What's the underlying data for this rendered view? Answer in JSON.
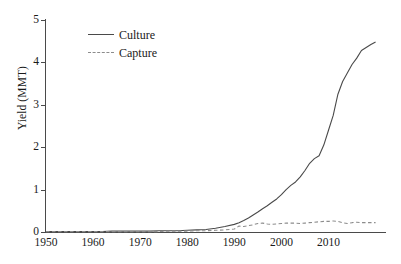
{
  "chart_data": {
    "type": "line",
    "title": "",
    "xlabel": "",
    "ylabel": "Yield (MMT)",
    "xlim": [
      1950,
      2022
    ],
    "ylim": [
      0,
      5
    ],
    "xticks": [
      1950,
      1960,
      1970,
      1980,
      1990,
      2000,
      2010
    ],
    "yticks": [
      0,
      1,
      2,
      3,
      4,
      5
    ],
    "grid": false,
    "legend_position": "top-left",
    "x": [
      1950,
      1952,
      1954,
      1956,
      1958,
      1960,
      1962,
      1964,
      1966,
      1968,
      1970,
      1972,
      1974,
      1976,
      1978,
      1980,
      1982,
      1984,
      1986,
      1988,
      1990,
      1991,
      1992,
      1993,
      1994,
      1995,
      1996,
      1997,
      1998,
      1999,
      2000,
      2001,
      2002,
      2003,
      2004,
      2005,
      2006,
      2007,
      2008,
      2009,
      2010,
      2011,
      2012,
      2013,
      2014,
      2015,
      2016,
      2017,
      2018,
      2019,
      2020
    ],
    "series": [
      {
        "name": "Culture",
        "style": "solid",
        "color": "#4a4a4a",
        "values": [
          0.01,
          0.01,
          0.01,
          0.01,
          0.01,
          0.01,
          0.01,
          0.02,
          0.02,
          0.02,
          0.02,
          0.02,
          0.03,
          0.03,
          0.03,
          0.04,
          0.05,
          0.06,
          0.09,
          0.13,
          0.18,
          0.22,
          0.27,
          0.33,
          0.4,
          0.47,
          0.55,
          0.62,
          0.7,
          0.78,
          0.88,
          1.0,
          1.1,
          1.18,
          1.3,
          1.45,
          1.62,
          1.73,
          1.8,
          2.05,
          2.4,
          2.75,
          3.25,
          3.55,
          3.75,
          3.95,
          4.1,
          4.28,
          4.35,
          4.42,
          4.48
        ]
      },
      {
        "name": "Capture",
        "style": "dashed",
        "color": "#8c8c8c",
        "values": [
          0.01,
          0.01,
          0.01,
          0.01,
          0.01,
          0.01,
          0.01,
          0.01,
          0.01,
          0.01,
          0.01,
          0.01,
          0.01,
          0.02,
          0.02,
          0.02,
          0.03,
          0.03,
          0.04,
          0.05,
          0.07,
          0.14,
          0.13,
          0.15,
          0.17,
          0.2,
          0.21,
          0.19,
          0.18,
          0.19,
          0.2,
          0.21,
          0.21,
          0.21,
          0.2,
          0.21,
          0.22,
          0.23,
          0.24,
          0.25,
          0.25,
          0.26,
          0.25,
          0.22,
          0.2,
          0.22,
          0.23,
          0.22,
          0.22,
          0.22,
          0.22
        ]
      }
    ]
  },
  "legend": {
    "items": [
      {
        "label": "Culture",
        "style": "solid"
      },
      {
        "label": "Capture",
        "style": "dashed"
      }
    ]
  },
  "axes": {
    "y_label": "Yield (MMT)",
    "y_tick_labels": [
      "0",
      "1",
      "2",
      "3",
      "4",
      "5"
    ],
    "x_tick_labels": [
      "1950",
      "1960",
      "1970",
      "1980",
      "1990",
      "2000",
      "2010"
    ]
  },
  "colors": {
    "culture": "#4a4a4a",
    "capture": "#8c8c8c",
    "axis": "#4a4a4a",
    "background": "#ffffff"
  }
}
